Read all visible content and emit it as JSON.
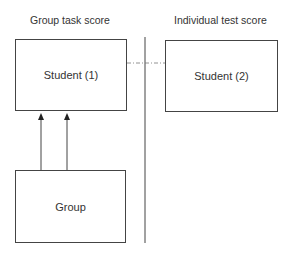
{
  "headers": {
    "left": "Group task score",
    "right": "Individual test score"
  },
  "nodes": {
    "student1": "Student (1)",
    "student2": "Student (2)",
    "group": "Group"
  },
  "edges": [
    {
      "from": "group",
      "to": "student1",
      "style": "solid-arrow",
      "count": 2
    },
    {
      "from": "student1",
      "to": "student2",
      "style": "dash-dot"
    }
  ],
  "colors": {
    "line": "#444444",
    "text": "#333333",
    "background": "#ffffff"
  }
}
